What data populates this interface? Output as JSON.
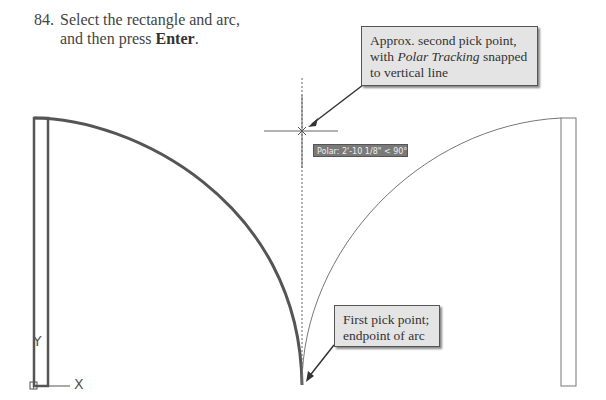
{
  "instruction": {
    "number": "84.",
    "line1": "Select the rectangle and arc,",
    "line2_prefix": "and then press ",
    "key": "Enter",
    "line2_suffix": "."
  },
  "callouts": {
    "second_pick": {
      "text_before": "Approx. second pick point, with ",
      "italic": "Polar Tracking",
      "text_after": " snapped to vertical line"
    },
    "first_pick": {
      "text": "First pick point; endpoint of arc"
    }
  },
  "tooltip": {
    "polar": "Polar: 2'-10 1/8\" < 90°"
  },
  "ucs": {
    "x_label": "X",
    "y_label": "Y"
  },
  "colors": {
    "callout_bg": "#e4e4e4",
    "tooltip_bg": "#7a7a7a",
    "line": "#555555"
  }
}
